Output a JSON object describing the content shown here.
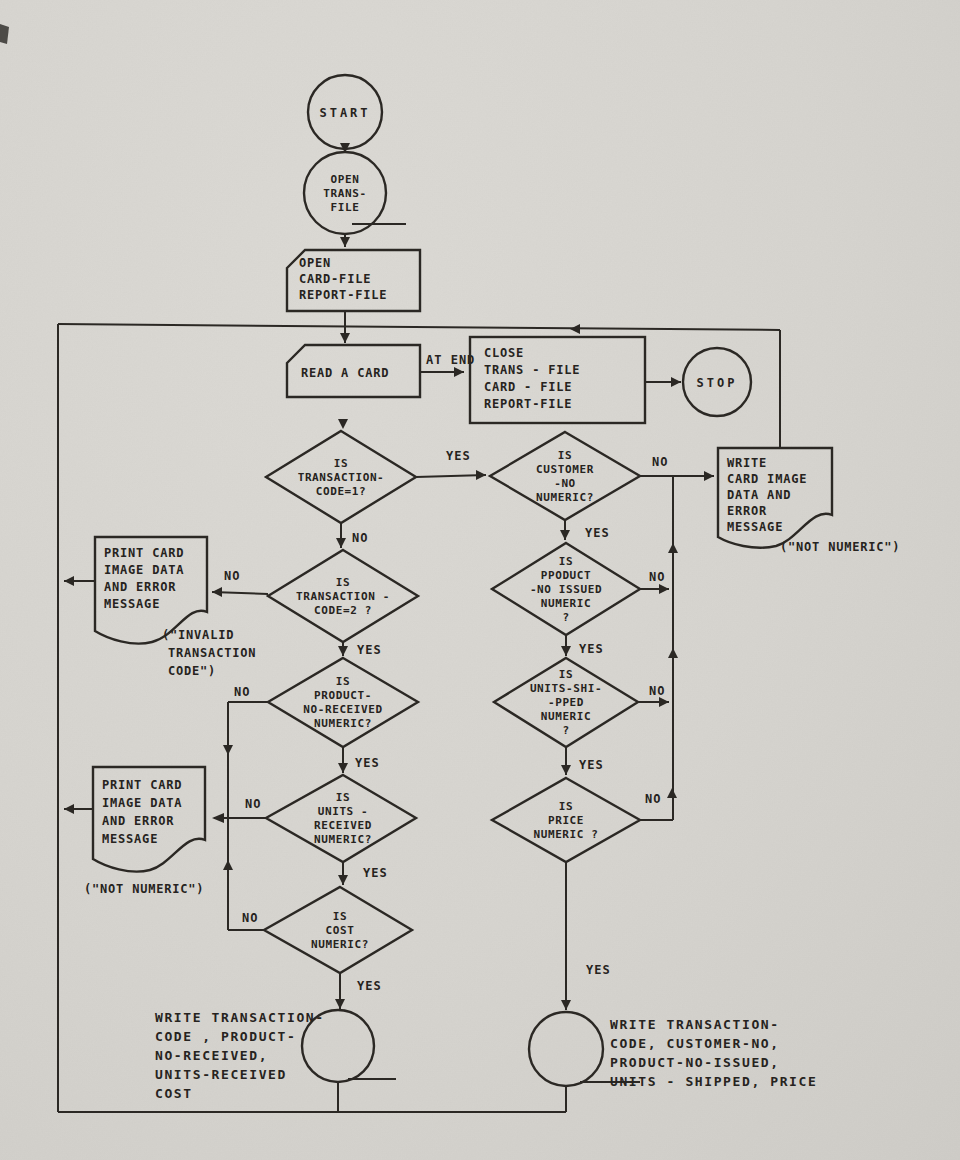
{
  "page": {
    "paper_color": "#d7d5d0",
    "ink_color": "#2b2824"
  },
  "labels": {
    "yes": "YES",
    "no": "NO",
    "at_end": "AT END"
  },
  "nodes": {
    "start": {
      "label": "START"
    },
    "open_trans": {
      "lines": [
        "OPEN",
        "TRANS-",
        "FILE"
      ]
    },
    "open_files": {
      "lines": [
        "OPEN",
        "CARD-FILE",
        "REPORT-FILE"
      ]
    },
    "read_card": {
      "label": "READ A CARD"
    },
    "close_files": {
      "lines": [
        "CLOSE",
        "TRANS - FILE",
        "CARD - FILE",
        "REPORT-FILE"
      ]
    },
    "stop": {
      "label": "STOP"
    },
    "d_code1": {
      "lines": [
        "IS",
        "TRANSACTION-",
        "CODE=1?"
      ]
    },
    "d_code2": {
      "lines": [
        "IS",
        "TRANSACTION -",
        "CODE=2 ?"
      ]
    },
    "d_product_received": {
      "lines": [
        "IS",
        "PRODUCT-",
        "NO-RECEIVED",
        "NUMERIC?"
      ]
    },
    "d_units_received": {
      "lines": [
        "IS",
        "UNITS -",
        "RECEIVED",
        "NUMERIC?"
      ]
    },
    "d_cost": {
      "lines": [
        "IS",
        "COST",
        "NUMERIC?"
      ]
    },
    "d_customer": {
      "lines": [
        "IS",
        "CUSTOMER",
        "-NO",
        "NUMERIC?"
      ]
    },
    "d_product_issued": {
      "lines": [
        "IS",
        "PPODUCT",
        "-NO ISSUED",
        "NUMERIC",
        "?"
      ]
    },
    "d_units_shipped": {
      "lines": [
        "IS",
        "UNITS-SHI-",
        "-PPED",
        "NUMERIC",
        "?"
      ]
    },
    "d_price": {
      "lines": [
        "IS",
        "PRICE",
        "NUMERIC ?"
      ]
    },
    "doc_invalid": {
      "lines": [
        "PRINT CARD",
        "IMAGE DATA",
        "AND ERROR",
        "MESSAGE"
      ],
      "caption": [
        "(\"INVALID",
        "TRANSACTION",
        "CODE\")"
      ]
    },
    "doc_not_numeric_left": {
      "lines": [
        "PRINT CARD",
        "IMAGE DATA",
        "AND ERROR",
        "MESSAGE"
      ],
      "caption": [
        "(\"NOT NUMERIC\")"
      ]
    },
    "doc_not_numeric_right": {
      "lines": [
        "WRITE",
        "CARD IMAGE",
        "DATA AND",
        "ERROR",
        "MESSAGE"
      ],
      "caption": [
        "(\"NOT NUMERIC\")"
      ]
    },
    "write_received": {
      "lines": [
        "WRITE TRANSACTION-",
        "CODE , PRODUCT-",
        "NO-RECEIVED,",
        "UNITS-RECEIVED",
        "COST"
      ]
    },
    "write_shipped": {
      "lines": [
        "WRITE TRANSACTION-",
        "CODE, CUSTOMER-NO,",
        "PRODUCT-NO-ISSUED,",
        "UNITS - SHIPPED, PRICE"
      ]
    }
  }
}
